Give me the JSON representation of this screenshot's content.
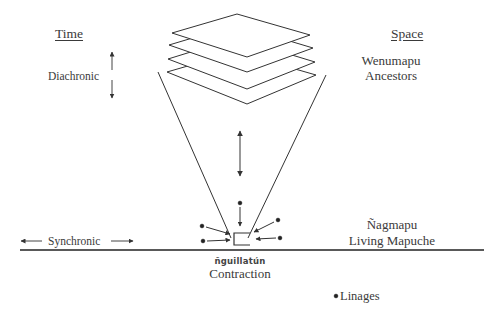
{
  "diagram": {
    "headers": {
      "time": "Time",
      "space": "Space"
    },
    "labels": {
      "diachronic": "Diachronic",
      "synchronic": "Synchronic",
      "wenumapu": "Wenumapu",
      "ancestors": "Ancestors",
      "nagmapu": "Ñagmapu",
      "living_mapuche": "Living Mapuche",
      "nguillatun": "ñguillatún",
      "contraction": "Contraction",
      "linages": "Linages"
    },
    "colors": {
      "stroke": "#333333",
      "text": "#3a3a3a",
      "background": "#ffffff"
    },
    "stacked_planes_count": 4
  }
}
